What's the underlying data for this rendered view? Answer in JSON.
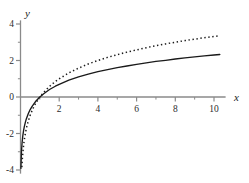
{
  "chart_data": {
    "type": "line",
    "title": "",
    "subtitle": "",
    "xlabel": "x",
    "ylabel": "y",
    "xlim": [
      0,
      10.6
    ],
    "ylim": [
      -4.2,
      4.2
    ],
    "grid": false,
    "legend_position": "none",
    "x_ticks_major": [
      2,
      4,
      6,
      8,
      10
    ],
    "x_tick_labels": [
      "2",
      "4",
      "6",
      "8",
      "10"
    ],
    "x_ticks_minor": [
      1,
      3,
      5,
      7,
      9
    ],
    "y_ticks_major": [
      4,
      2,
      0,
      -2,
      -4
    ],
    "y_tick_labels": [
      "4",
      "2",
      "0",
      "-2",
      "-4"
    ],
    "y_ticks_minor": [
      3,
      1,
      -1,
      -3
    ],
    "axis_color": "#8a8a8a",
    "curve_color": "#1a1a1a",
    "background": "#ffffff",
    "series": [
      {
        "name": "solid-curve",
        "style": "solid",
        "color": "#1a1a1a",
        "x": [
          0.02,
          0.05,
          0.08,
          0.12,
          0.16,
          0.2,
          0.25,
          0.3,
          0.4,
          0.5,
          0.6,
          0.7,
          0.8,
          0.9,
          1.0,
          1.2,
          1.5,
          1.8,
          2.0,
          2.5,
          3.0,
          3.5,
          4.0,
          4.5,
          5.0,
          5.5,
          6.0,
          6.5,
          7.0,
          7.5,
          8.0,
          8.5,
          9.0,
          9.5,
          10.0,
          10.3
        ],
        "y": [
          -3.91,
          -3.0,
          -2.53,
          -2.12,
          -1.83,
          -1.61,
          -1.39,
          -1.2,
          -0.92,
          -0.69,
          -0.51,
          -0.36,
          -0.22,
          -0.11,
          0.0,
          0.18,
          0.41,
          0.59,
          0.69,
          0.92,
          1.1,
          1.25,
          1.39,
          1.5,
          1.61,
          1.7,
          1.79,
          1.87,
          1.95,
          2.01,
          2.08,
          2.14,
          2.2,
          2.25,
          2.3,
          2.33
        ]
      },
      {
        "name": "dotted-curve",
        "style": "dotted",
        "color": "#1a1a1a",
        "x": [
          0.07,
          0.1,
          0.14,
          0.18,
          0.22,
          0.27,
          0.33,
          0.4,
          0.5,
          0.6,
          0.7,
          0.8,
          0.9,
          1.0,
          1.2,
          1.5,
          1.8,
          2.0,
          2.5,
          3.0,
          3.5,
          4.0,
          4.5,
          5.0,
          5.5,
          6.0,
          6.5,
          7.0,
          7.5,
          8.0,
          8.5,
          9.0,
          9.5,
          10.0,
          10.3
        ],
        "y": [
          -3.84,
          -3.32,
          -2.84,
          -2.47,
          -2.18,
          -1.89,
          -1.6,
          -1.32,
          -1.0,
          -0.74,
          -0.51,
          -0.32,
          -0.15,
          0.0,
          0.26,
          0.58,
          0.85,
          1.0,
          1.32,
          1.58,
          1.81,
          2.0,
          2.17,
          2.32,
          2.46,
          2.58,
          2.7,
          2.81,
          2.91,
          3.0,
          3.09,
          3.17,
          3.25,
          3.32,
          3.36
        ]
      }
    ]
  }
}
